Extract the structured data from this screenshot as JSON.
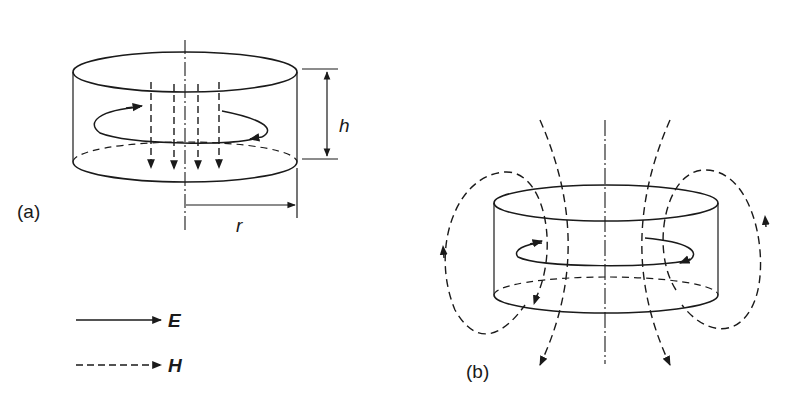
{
  "figure": {
    "panel_a": {
      "label": "(a)",
      "dimension_height": "h",
      "dimension_radius": "r"
    },
    "panel_b": {
      "label": "(b)"
    },
    "legend": {
      "items": [
        {
          "line_style": "solid",
          "symbol": "E"
        },
        {
          "line_style": "dashed",
          "symbol": "H"
        }
      ]
    }
  }
}
